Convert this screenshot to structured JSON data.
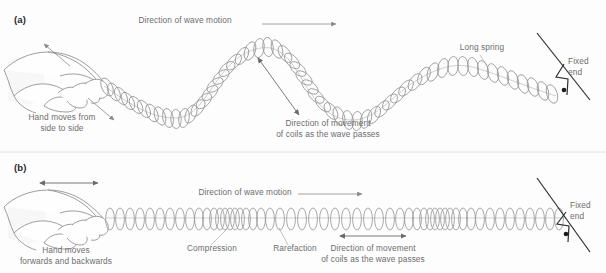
{
  "figure": {
    "title_a": "(a)",
    "title_b": "(b)",
    "accent_color": "#6d6d6d",
    "line_color": "#9a9a9a",
    "wall_color": "#2e2e2e"
  },
  "panel_a": {
    "label": "(a)",
    "wave_motion_label": "Direction of wave motion",
    "hand_label": "Hand moves from\nside to side",
    "coil_movement_label": "Direction of movement\nof coils as the wave passes",
    "spring_label": "Long spring",
    "fixed_end_label": "Fixed\nend"
  },
  "panel_b": {
    "label": "(b)",
    "wave_motion_label": "Direction of wave motion",
    "hand_label": "Hand moves\nforwards and backwards",
    "compression_label": "Compression",
    "rarefaction_label": "Rarefaction",
    "coil_movement_label": "Direction of movement\nof coils as the wave passes",
    "fixed_end_label": "Fixed\nend"
  },
  "icons": {
    "hand_a": "hand-side-to-side-icon",
    "hand_b": "hand-forwards-backwards-icon",
    "wall_a": "fixed-end-wall-icon",
    "wall_b": "fixed-end-wall-icon",
    "spring_a": "transverse-spring-icon",
    "spring_b": "longitudinal-spring-icon"
  }
}
